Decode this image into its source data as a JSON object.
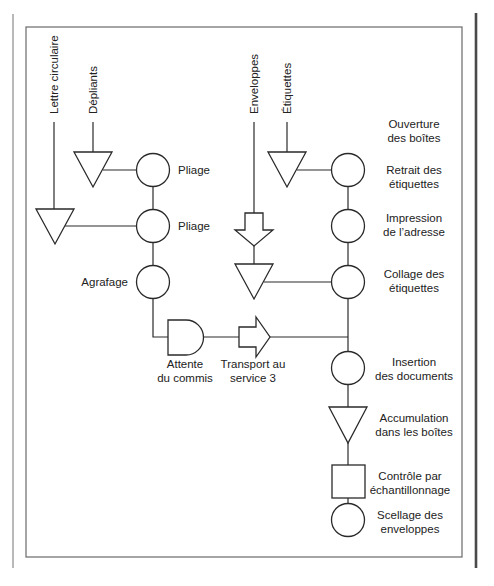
{
  "diagram": {
    "type": "process-flow-chart",
    "language": "fr",
    "inputs": [
      {
        "id": "lettre",
        "label": "Lettre circulaire"
      },
      {
        "id": "depliants",
        "label": "Dépliants"
      },
      {
        "id": "enveloppes",
        "label": "Enveloppes"
      },
      {
        "id": "etiquettes",
        "label": "Étiquettes"
      }
    ],
    "left_steps": [
      {
        "symbol": "operation-circle",
        "label": "Pliage"
      },
      {
        "symbol": "operation-circle",
        "label": "Pliage"
      },
      {
        "symbol": "operation-circle",
        "label": "Agrafage"
      }
    ],
    "bottom_steps": [
      {
        "symbol": "delay-d",
        "label_line1": "Attente",
        "label_line2": "du commis"
      },
      {
        "symbol": "transport-arrow",
        "label_line1": "Transport au",
        "label_line2": "service 3"
      }
    ],
    "right_steps": [
      {
        "symbol": "none",
        "label_line1": "Ouverture",
        "label_line2": "des boîtes"
      },
      {
        "symbol": "operation-circle",
        "label_line1": "Retrait des",
        "label_line2": "étiquettes"
      },
      {
        "symbol": "operation-circle",
        "label_line1": "Impression",
        "label_line2": "de l’adresse"
      },
      {
        "symbol": "operation-circle",
        "label_line1": "Collage des",
        "label_line2": "étiquettes"
      },
      {
        "symbol": "operation-circle",
        "label_line1": "Insertion",
        "label_line2": "des documents"
      },
      {
        "symbol": "storage-triangle",
        "label_line1": "Accumulation",
        "label_line2": "dans les boîtes"
      },
      {
        "symbol": "inspection-square",
        "label_line1": "Contrôle par",
        "label_line2": "échantillonnage"
      },
      {
        "symbol": "operation-circle",
        "label_line1": "Scellage des",
        "label_line2": "enveloppes"
      }
    ],
    "colors": {
      "stroke": "#2a2a2a",
      "frame": "#6a6a6a",
      "background": "#ffffff"
    }
  }
}
